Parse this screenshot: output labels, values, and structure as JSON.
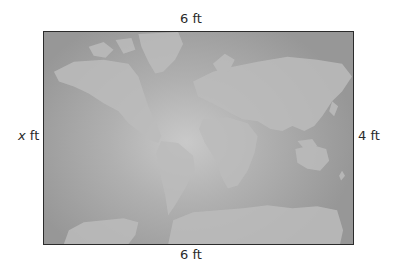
{
  "figure": {
    "type": "rectangular world map with dimension labels",
    "top_label": {
      "value": "6",
      "unit": "ft"
    },
    "bottom_label": {
      "value": "6",
      "unit": "ft"
    },
    "left_label": {
      "variable": "x",
      "unit": "ft"
    },
    "right_label": {
      "value": "4",
      "unit": "ft"
    }
  },
  "colors": {
    "frame_border": "#2b2b2b",
    "ocean_center": "#c9c9c9",
    "ocean_edge": "#979797",
    "land": "#bdbdbd"
  }
}
